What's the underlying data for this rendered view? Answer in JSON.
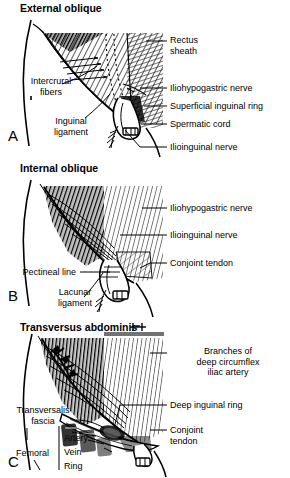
{
  "figure": {
    "background_color": "#ffffff",
    "ink_color": "#000000"
  },
  "panels": [
    {
      "letter": "A",
      "title": "External oblique",
      "labels": [
        {
          "name": "rectus-sheath",
          "text": "Rectus\nsheath"
        },
        {
          "name": "intercrural-fibers",
          "text": "Intercrural\nfibers"
        },
        {
          "name": "inguinal-ligament",
          "text": "Inguinal\nligament"
        },
        {
          "name": "iliohypogastric-nerve",
          "text": "Iliohypogastric nerve"
        },
        {
          "name": "superficial-inguinal-ring",
          "text": "Superficial inguinal ring"
        },
        {
          "name": "spermatic-cord",
          "text": "Spermatic cord"
        },
        {
          "name": "ilioinguinal-nerve",
          "text": "Ilioinguinal nerve"
        }
      ]
    },
    {
      "letter": "B",
      "title": "Internal oblique",
      "labels": [
        {
          "name": "iliohypogastric-nerve",
          "text": "Iliohypogastric nerve"
        },
        {
          "name": "ilioinguinal-nerve",
          "text": "Ilioinguinal nerve"
        },
        {
          "name": "conjoint-tendon",
          "text": "Conjoint tendon"
        },
        {
          "name": "pectineal-line",
          "text": "Pectineal line"
        },
        {
          "name": "lacunar-ligament",
          "text": "Lacunar\nligament"
        }
      ]
    },
    {
      "letter": "C",
      "title": "Transversus abdominis",
      "labels": [
        {
          "name": "deep-circumflex-iliac-artery",
          "text": "Branches of\ndeep circumflex\niliac artery"
        },
        {
          "name": "deep-inguinal-ring",
          "text": "Deep inguinal ring"
        },
        {
          "name": "conjoint-tendon",
          "text": "Conjoint\ntendon"
        },
        {
          "name": "transversalis-fascia",
          "text": "Transversalis\nfascia"
        },
        {
          "name": "femoral-group",
          "text": "Femoral"
        },
        {
          "name": "femoral-artery",
          "text": "Artery"
        },
        {
          "name": "femoral-vein",
          "text": "Vein"
        },
        {
          "name": "femoral-ring",
          "text": "Ring"
        }
      ]
    }
  ]
}
